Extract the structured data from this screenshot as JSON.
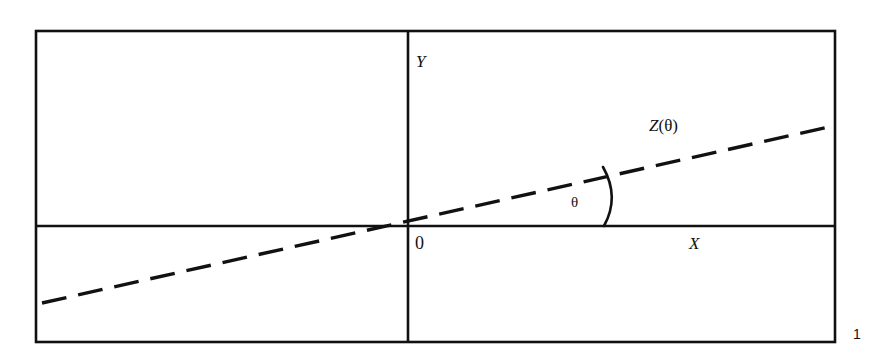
{
  "figure": {
    "kind": "line-diagram",
    "background_color": "#ffffff",
    "stroke_color": "#111111",
    "caption_number": "1",
    "frame": {
      "name": "bounding-box",
      "left": 36,
      "top": 31,
      "right": 835,
      "bottom": 342,
      "stroke_width": 2.6
    },
    "axes": {
      "x_axis": {
        "label": "X",
        "label_x": 689,
        "label_y": 249,
        "y": 226,
        "x_start": 36,
        "x_end": 835,
        "stroke_width": 2.6
      },
      "y_axis": {
        "label": "Y",
        "label_x": 416,
        "label_y": 67,
        "x": 408,
        "y_start": 31,
        "y_end": 342,
        "stroke_width": 2.6
      },
      "origin": {
        "label": "0",
        "label_x": 415,
        "label_y": 249,
        "x": 408,
        "y": 226
      }
    },
    "line": {
      "name": "Z-theta-line",
      "label_plain": "Z(θ)",
      "label_italic_part": "Z",
      "label_paren_open": "(",
      "label_symbol": "θ",
      "label_paren_close": ")",
      "label_x": 649,
      "label_y": 131,
      "style": "dashed",
      "dash_length": 25,
      "dash_gap": 12,
      "stroke_width": 3.4,
      "x1": 42,
      "y1": 303,
      "x2": 833,
      "y2": 126
    },
    "angle": {
      "name": "theta-angle",
      "symbol": "θ",
      "symbol_x": 571,
      "symbol_y": 207,
      "arc_start_x": 604,
      "arc_start_y": 226,
      "arc_ctrl_x": 620,
      "arc_ctrl_y": 197,
      "arc_end_x": 603,
      "arc_end_y": 167,
      "stroke_width": 2.6
    }
  }
}
